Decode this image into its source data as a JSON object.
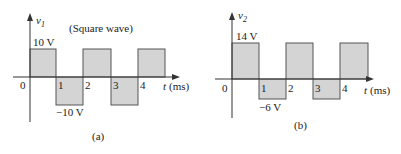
{
  "figure_a": {
    "y_label": "v",
    "y_label_sub": "1",
    "title": "(Square wave)",
    "high_label": "10 V",
    "low_label": "−10 V",
    "origin_label": "0",
    "ticks": [
      "1",
      "2",
      "3",
      "4"
    ],
    "x_label_t": "t",
    "x_label_unit": "(ms)",
    "caption": "(a)"
  },
  "figure_b": {
    "y_label": "v",
    "y_label_sub": "2",
    "high_label": "14 V",
    "low_label": "−6  V",
    "origin_label": "0",
    "ticks": [
      "1",
      "2",
      "3",
      "4"
    ],
    "x_label_t": "t",
    "x_label_unit": "(ms)",
    "caption": "(b)"
  },
  "colors": {
    "fill": "#d4d4d4",
    "stroke": "#555555",
    "axis": "#333333"
  }
}
